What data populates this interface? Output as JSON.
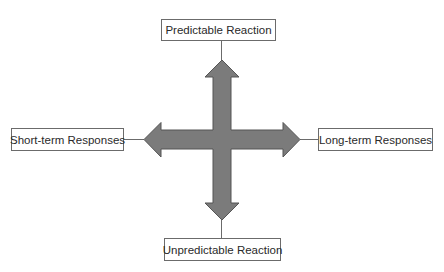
{
  "diagram": {
    "type": "four-way-arrow-quadrant",
    "axes": {
      "vertical": {
        "top_label": "Predictable Reaction",
        "bottom_label": "Unpredictable Reaction"
      },
      "horizontal": {
        "left_label": "Short-term Responses",
        "right_label": "Long-term Responses"
      }
    },
    "colors": {
      "arrow_fill": "#7b7b7b",
      "arrow_stroke": "#555555",
      "connector": "#6b6b6b",
      "box_border": "#6b6b6b",
      "text": "#2a2a2a",
      "background": "#ffffff"
    }
  }
}
